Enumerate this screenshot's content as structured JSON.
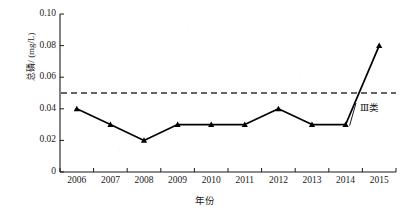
{
  "chart_data": {
    "type": "line",
    "title": "",
    "xlabel": "年份",
    "ylabel": "总磷/ (mg/L)",
    "categories": [
      "2006",
      "2007",
      "2008",
      "2009",
      "2010",
      "2011",
      "2012",
      "2013",
      "2014",
      "2015"
    ],
    "values": [
      0.04,
      0.03,
      0.02,
      0.03,
      0.03,
      0.03,
      0.04,
      0.03,
      0.03,
      0.08
    ],
    "series": [
      {
        "name": "总磷",
        "values": [
          0.04,
          0.03,
          0.02,
          0.03,
          0.03,
          0.03,
          0.04,
          0.03,
          0.03,
          0.08
        ],
        "marker": "triangle",
        "color": "#000000",
        "line_style": "solid"
      }
    ],
    "ylim": [
      0,
      0.1
    ],
    "xlim": [
      "2006",
      "2015"
    ],
    "yticks": [
      0,
      0.02,
      0.04,
      0.06,
      0.08,
      0.1
    ],
    "ytick_labels": [
      "0",
      "0.02",
      "0.04",
      "0.06",
      "0.08",
      "0.10"
    ],
    "xtick_labels": [
      "2006",
      "2007",
      "2008",
      "2009",
      "2010",
      "2011",
      "2012",
      "2013",
      "2014",
      "2015"
    ],
    "grid": false,
    "legend": false,
    "legend_position": "none",
    "reference_lines": [
      {
        "name": "class-iii-threshold",
        "value": 0.05,
        "label": "Ⅲ类",
        "line_style": "dashed",
        "color": "#333333",
        "orientation": "horizontal"
      }
    ],
    "annotations": [
      {
        "text": "Ⅲ类",
        "x": 0.05,
        "y": 0.043,
        "leader_line": true
      }
    ]
  },
  "axis": {
    "y_title": "总磷/ (mg/L)",
    "x_title": "年份"
  },
  "colors": {
    "line": "#000000",
    "axis": "#1a1a1a",
    "reference": "#333333",
    "background": "#ffffff"
  }
}
